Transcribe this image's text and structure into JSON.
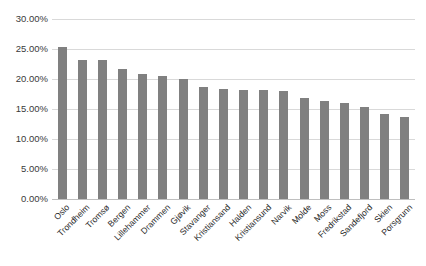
{
  "chart_data": {
    "type": "bar",
    "title": "",
    "xlabel": "",
    "ylabel": "",
    "ylim": [
      0,
      30
    ],
    "ytick_labels": [
      "30.00%",
      "25.00%",
      "20.00%",
      "15.00%",
      "10.00%",
      "5.00%",
      "0.00%"
    ],
    "ytick_values": [
      30,
      25,
      20,
      15,
      10,
      5,
      0
    ],
    "grid": true,
    "legend": "none",
    "bar_color": "#808080",
    "gridline_color": "#d9d9d9",
    "value_suffix": "%",
    "categories": [
      "Oslo",
      "Trondheim",
      "Tromsø",
      "Bergen",
      "Lillehammer",
      "Drammen",
      "Gjøvik",
      "Stavanger",
      "Kristiansand",
      "Halden",
      "Kristiansund",
      "Narvik",
      "Molde",
      "Moss",
      "Fredrikstad",
      "Sandefjord",
      "Skien",
      "Porsgrunn"
    ],
    "values": [
      25.3,
      23.2,
      23.1,
      21.6,
      20.9,
      20.5,
      20.0,
      18.6,
      18.3,
      18.2,
      18.2,
      18.0,
      16.9,
      16.3,
      16.0,
      15.4,
      14.2,
      13.7
    ]
  }
}
